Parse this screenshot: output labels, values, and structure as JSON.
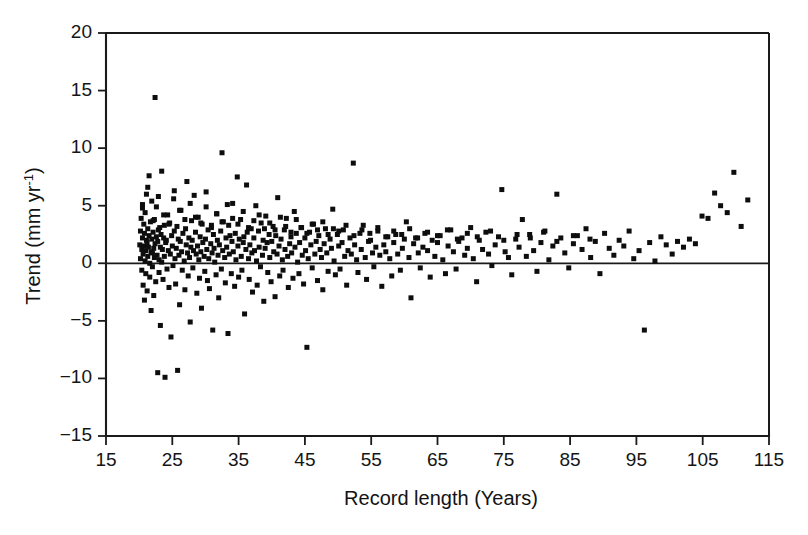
{
  "chart_data": {
    "type": "scatter",
    "title": "",
    "xlabel": "Record length (Years)",
    "ylabel": "Trend (mm yr-1)",
    "ylabel_base": "Trend (mm yr",
    "ylabel_sup": "-1",
    "ylabel_close": ")",
    "xlim": [
      15,
      115
    ],
    "ylim": [
      -15,
      20
    ],
    "xticks": [
      15,
      25,
      35,
      45,
      55,
      65,
      75,
      85,
      95,
      105,
      115
    ],
    "yticks": [
      20,
      15,
      10,
      5,
      0,
      -5,
      -10,
      -15
    ],
    "xticklabels": [
      "15",
      "25",
      "35",
      "45",
      "55",
      "65",
      "75",
      "85",
      "95",
      "105",
      "115"
    ],
    "yticklabels": [
      "20",
      "15",
      "10",
      "5",
      "0",
      "−5",
      "−10",
      "−15"
    ],
    "grid": false,
    "legend": null,
    "marker": "square",
    "marker_size_px": 5,
    "marker_color": "#0d0d0d",
    "reference_lines": [
      {
        "axis": "y",
        "value": 0,
        "color": "#1a1a1a"
      }
    ],
    "n_points": 452,
    "x": [
      20.1,
      20.2,
      20.2,
      20.3,
      20.4,
      20.4,
      20.5,
      20.5,
      20.6,
      20.6,
      20.7,
      20.7,
      20.8,
      20.8,
      20.9,
      20.9,
      21.0,
      21.0,
      21.1,
      21.1,
      21.2,
      21.2,
      21.3,
      21.3,
      21.4,
      21.5,
      21.5,
      21.6,
      21.6,
      21.7,
      21.8,
      21.8,
      21.9,
      21.9,
      22.0,
      22.0,
      22.1,
      22.2,
      22.2,
      22.3,
      22.3,
      22.4,
      22.4,
      22.5,
      22.6,
      22.6,
      22.7,
      22.8,
      22.8,
      22.9,
      23.0,
      23.0,
      23.1,
      23.2,
      23.2,
      23.3,
      23.4,
      23.4,
      23.5,
      23.6,
      23.7,
      23.8,
      23.8,
      23.9,
      24.0,
      24.1,
      24.2,
      24.3,
      24.4,
      24.5,
      24.6,
      24.7,
      24.8,
      24.9,
      25.0,
      25.1,
      25.2,
      25.3,
      25.4,
      25.5,
      25.6,
      25.7,
      25.8,
      25.9,
      26.0,
      26.1,
      26.2,
      26.3,
      26.4,
      26.5,
      26.6,
      26.8,
      26.9,
      27.0,
      27.1,
      27.2,
      27.3,
      27.4,
      27.5,
      27.6,
      27.7,
      27.8,
      27.9,
      28.0,
      28.1,
      28.2,
      28.3,
      28.5,
      28.6,
      28.7,
      28.8,
      28.9,
      29.0,
      29.1,
      29.2,
      29.3,
      29.4,
      29.5,
      29.6,
      29.8,
      29.9,
      30.0,
      30.1,
      30.2,
      30.3,
      30.4,
      30.5,
      30.6,
      30.8,
      30.9,
      31.0,
      31.1,
      31.2,
      31.3,
      31.4,
      31.6,
      31.7,
      31.8,
      31.9,
      32.0,
      32.1,
      32.3,
      32.4,
      32.5,
      32.6,
      32.7,
      32.9,
      33.0,
      33.1,
      33.2,
      33.4,
      33.5,
      33.6,
      33.7,
      33.9,
      34.0,
      34.1,
      34.2,
      34.4,
      34.5,
      34.6,
      34.8,
      34.9,
      35.0,
      35.1,
      35.3,
      35.4,
      35.5,
      35.7,
      35.8,
      35.9,
      36.1,
      36.2,
      36.3,
      36.5,
      36.6,
      36.7,
      36.9,
      37.0,
      37.1,
      37.3,
      37.4,
      37.6,
      37.7,
      37.8,
      38.0,
      38.1,
      38.3,
      38.4,
      38.6,
      38.7,
      38.8,
      39.0,
      39.1,
      39.3,
      39.4,
      39.6,
      39.7,
      39.9,
      40.0,
      40.2,
      40.3,
      40.5,
      40.6,
      40.8,
      40.9,
      41.1,
      41.2,
      41.4,
      41.6,
      41.7,
      41.9,
      42.0,
      42.2,
      42.4,
      42.5,
      42.7,
      42.9,
      43.0,
      43.2,
      43.4,
      43.5,
      43.7,
      43.9,
      44.1,
      44.2,
      44.4,
      44.6,
      44.8,
      45.0,
      45.1,
      45.3,
      45.5,
      45.7,
      45.9,
      46.1,
      46.3,
      46.5,
      46.7,
      46.9,
      47.1,
      47.3,
      47.5,
      47.7,
      47.9,
      48.1,
      48.3,
      48.5,
      48.8,
      49.0,
      49.2,
      49.4,
      49.6,
      49.9,
      50.1,
      50.3,
      50.6,
      50.8,
      51.0,
      51.3,
      51.5,
      51.8,
      52.0,
      52.3,
      52.5,
      52.8,
      53.0,
      53.3,
      53.5,
      53.8,
      54.1,
      54.3,
      54.6,
      54.9,
      55.2,
      55.4,
      55.7,
      56.0,
      56.3,
      56.6,
      56.9,
      57.2,
      57.5,
      57.8,
      58.1,
      58.4,
      58.7,
      59.0,
      59.4,
      59.7,
      60.0,
      60.3,
      60.7,
      61.0,
      61.4,
      61.7,
      62.1,
      62.4,
      62.8,
      63.1,
      63.5,
      63.9,
      64.2,
      64.6,
      65.0,
      65.4,
      65.8,
      66.2,
      66.6,
      67.0,
      67.4,
      67.8,
      68.2,
      68.7,
      69.1,
      69.5,
      70.0,
      70.4,
      70.9,
      71.3,
      71.8,
      72.3,
      72.7,
      73.2,
      73.7,
      74.2,
      74.7,
      75.2,
      75.7,
      76.2,
      76.8,
      77.3,
      77.8,
      78.4,
      78.9,
      79.5,
      80.0,
      80.6,
      81.2,
      81.8,
      82.4,
      83.0,
      83.6,
      84.2,
      84.8,
      85.5,
      86.1,
      86.8,
      87.4,
      88.1,
      88.8,
      89.5,
      90.2,
      90.9,
      91.6,
      92.4,
      93.1,
      93.9,
      94.6,
      95.4,
      96.2,
      97.0,
      97.8,
      98.7,
      99.5,
      100.4,
      101.2,
      102.1,
      103.0,
      103.9,
      104.9,
      105.8,
      106.8,
      107.7,
      108.7,
      109.7,
      110.8,
      111.8,
      20.5,
      21.3,
      22.1,
      22.9,
      23.7,
      24.5,
      25.3,
      26.1,
      26.9,
      27.7,
      28.5,
      29.3,
      30.1,
      30.9,
      31.7,
      32.5,
      33.3,
      34.1,
      34.9,
      35.7,
      36.5,
      37.3,
      38.1,
      38.9,
      39.7,
      40.5,
      41.3,
      42.1,
      42.9,
      43.7,
      44.5,
      45.3,
      46.1,
      46.9,
      47.7,
      48.5,
      49.3,
      50.1,
      51.2,
      52.4,
      53.6,
      54.8,
      56.0,
      57.2,
      58.4,
      59.6,
      60.8,
      62.0,
      63.5,
      65.0,
      66.5,
      68.0,
      69.5,
      71.0,
      73.0,
      75.0,
      77.0,
      79.0,
      81.0,
      83.0,
      85.5,
      88.0,
      90.5,
      93.0,
      96.0,
      99.0,
      102.0,
      105.0,
      108.5,
      112.0
    ],
    "y": [
      1.6,
      2.8,
      0.4,
      3.9,
      -0.6,
      1.2,
      5.1,
      2.2,
      -1.9,
      0.8,
      3.4,
      1.5,
      -3.2,
      2.6,
      0.2,
      4.4,
      1.1,
      -0.9,
      2.0,
      6.0,
      1.8,
      -2.4,
      3.0,
      0.6,
      1.4,
      7.6,
      2.4,
      -1.2,
      0.0,
      3.6,
      1.0,
      -4.1,
      2.1,
      5.4,
      0.9,
      -0.3,
      2.7,
      1.3,
      -2.8,
      3.8,
      0.5,
      14.4,
      1.7,
      -1.6,
      2.3,
      4.9,
      0.7,
      -9.5,
      1.9,
      2.9,
      0.3,
      -0.8,
      3.1,
      1.4,
      -5.4,
      2.5,
      0.1,
      8.0,
      1.2,
      -1.4,
      2.2,
      3.3,
      0.6,
      -9.9,
      1.8,
      2.0,
      -0.5,
      4.2,
      1.1,
      -2.1,
      3.5,
      0.8,
      -6.4,
      2.4,
      1.5,
      -0.2,
      5.6,
      2.8,
      0.4,
      -1.8,
      1.3,
      3.2,
      -9.3,
      2.1,
      0.7,
      -3.6,
      1.9,
      4.6,
      1.0,
      -0.6,
      2.6,
      0.2,
      -2.3,
      3.0,
      1.6,
      7.1,
      0.9,
      -1.1,
      2.2,
      0.5,
      -5.1,
      1.4,
      3.7,
      2.0,
      -0.4,
      1.1,
      5.9,
      2.7,
      0.8,
      -2.6,
      1.5,
      4.0,
      0.3,
      -1.3,
      2.3,
      1.0,
      -3.9,
      3.4,
      1.8,
      0.6,
      -0.7,
      2.1,
      6.2,
      1.2,
      -1.5,
      2.9,
      0.4,
      -2.2,
      1.7,
      3.1,
      0.9,
      -5.8,
      2.5,
      1.3,
      0.1,
      -1.0,
      4.3,
      2.0,
      0.7,
      -3.0,
      1.6,
      2.8,
      -0.5,
      9.6,
      1.1,
      3.6,
      0.5,
      -1.7,
      2.2,
      1.4,
      -6.1,
      3.3,
      0.8,
      2.4,
      -0.9,
      1.9,
      5.2,
      1.0,
      -2.0,
      2.6,
      0.3,
      7.5,
      1.5,
      -1.2,
      2.1,
      3.8,
      0.6,
      -0.6,
      1.8,
      2.3,
      -4.4,
      1.2,
      6.8,
      2.7,
      0.4,
      -1.4,
      1.6,
      3.0,
      0.9,
      -2.5,
      2.2,
      1.1,
      5.0,
      0.2,
      -1.9,
      2.8,
      1.4,
      -0.3,
      3.5,
      0.7,
      2.0,
      -3.3,
      1.3,
      4.1,
      1.8,
      -0.8,
      2.5,
      0.5,
      -1.6,
      1.9,
      3.2,
      1.0,
      -2.9,
      2.4,
      0.8,
      5.7,
      1.5,
      -1.1,
      2.1,
      0.3,
      -0.6,
      2.9,
      1.2,
      3.9,
      0.6,
      -2.1,
      1.7,
      2.3,
      0.9,
      -1.3,
      4.5,
      1.4,
      2.6,
      0.1,
      -0.9,
      1.8,
      3.1,
      0.7,
      -1.8,
      2.2,
      1.1,
      -7.3,
      0.4,
      2.7,
      1.6,
      -0.4,
      3.4,
      0.8,
      1.9,
      -1.5,
      2.4,
      1.2,
      0.5,
      -2.3,
      1.7,
      3.0,
      0.9,
      -0.7,
      2.1,
      1.3,
      4.7,
      0.2,
      -1.0,
      2.5,
      1.5,
      -0.5,
      1.8,
      2.9,
      0.6,
      -1.9,
      1.1,
      2.2,
      0.8,
      8.7,
      1.6,
      0.3,
      -0.8,
      2.6,
      1.2,
      3.3,
      0.5,
      -1.4,
      1.9,
      2.0,
      0.9,
      -0.3,
      1.4,
      2.8,
      0.7,
      -2.0,
      1.6,
      1.0,
      2.3,
      0.4,
      -1.1,
      1.8,
      2.5,
      0.8,
      -0.6,
      1.3,
      2.1,
      3.6,
      0.5,
      -3.0,
      1.7,
      2.2,
      0.9,
      -0.4,
      1.4,
      2.6,
      1.1,
      -1.2,
      2.0,
      0.6,
      1.8,
      2.4,
      0.3,
      -0.9,
      1.5,
      2.9,
      1.0,
      -0.5,
      1.9,
      2.2,
      0.7,
      1.3,
      3.1,
      0.4,
      -1.6,
      2.0,
      1.2,
      2.7,
      0.8,
      -0.2,
      1.6,
      2.3,
      6.4,
      1.0,
      0.5,
      -1.0,
      2.1,
      1.4,
      3.8,
      0.6,
      2.5,
      1.1,
      -0.7,
      1.8,
      2.8,
      0.3,
      1.5,
      6.0,
      2.2,
      0.9,
      -0.4,
      1.7,
      2.4,
      1.2,
      3.0,
      0.5,
      1.9,
      -0.9,
      2.6,
      1.3,
      0.7,
      2.0,
      1.5,
      2.8,
      0.4,
      1.1,
      -5.8,
      1.8,
      0.2,
      2.3,
      1.6,
      0.8,
      1.9,
      1.4,
      2.1,
      1.7,
      4.1,
      3.9,
      6.1,
      5.0,
      4.4,
      7.9,
      3.2,
      5.5,
      4.8,
      6.6,
      3.7,
      5.8,
      4.2,
      3.4,
      6.3,
      4.6,
      3.8,
      5.2,
      4.0,
      3.5,
      4.9,
      3.3,
      4.3,
      3.6,
      5.1,
      3.9,
      3.4,
      4.5,
      3.1,
      3.7,
      4.2,
      3.0,
      3.5,
      2.9,
      4.0,
      3.2,
      2.7,
      3.8,
      3.1,
      2.6,
      3.4,
      2.9,
      3.6,
      2.5,
      3.0,
      2.8,
      3.3,
      2.4,
      2.9,
      2.6,
      3.1,
      2.3,
      2.8,
      2.5,
      3.0,
      2.2,
      2.7,
      2.4,
      2.9,
      2.1,
      2.6,
      2.3,
      2.8,
      2.0,
      2.5,
      2.2,
      2.7,
      1.9,
      2.4,
      2.1
    ]
  }
}
